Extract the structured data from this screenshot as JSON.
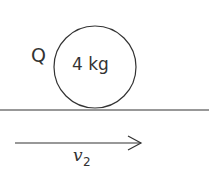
{
  "diagram": {
    "object": {
      "name": "Q",
      "mass_label": "4 kg",
      "shape": "circle"
    },
    "surface": "horizontal line",
    "velocity": {
      "symbol": "v",
      "subscript": "2",
      "direction": "right"
    },
    "colors": {
      "stroke": "#333333",
      "background": "#ffffff"
    }
  }
}
